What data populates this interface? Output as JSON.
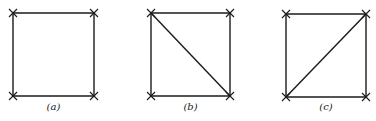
{
  "figures": [
    {
      "label": "(a)",
      "vertices": [
        "top-left",
        "top-right",
        "bottom-right",
        "bottom-left"
      ],
      "edges": [
        [
          "top-left",
          "top-right"
        ],
        [
          "top-right",
          "bottom-right"
        ],
        [
          "bottom-right",
          "bottom-left"
        ],
        [
          "bottom-left",
          "top-left"
        ]
      ]
    },
    {
      "label": "(b)",
      "vertices": [
        "top-left",
        "top-right",
        "bottom-right",
        "bottom-left"
      ],
      "edges": [
        [
          "top-left",
          "top-right"
        ],
        [
          "top-right",
          "bottom-right"
        ],
        [
          "bottom-right",
          "bottom-left"
        ],
        [
          "bottom-left",
          "top-left"
        ],
        [
          "top-left",
          "bottom-right"
        ]
      ]
    },
    {
      "label": "(c)",
      "vertices": [
        "top-left",
        "top-right",
        "bottom-right",
        "bottom-left"
      ],
      "edges": [
        [
          "top-left",
          "top-right"
        ],
        [
          "top-right",
          "bottom-right"
        ],
        [
          "bottom-right",
          "bottom-left"
        ],
        [
          "bottom-left",
          "top-left"
        ],
        [
          "bottom-left",
          "top-right"
        ]
      ]
    }
  ],
  "vertex_marker": "x-cross-icon"
}
